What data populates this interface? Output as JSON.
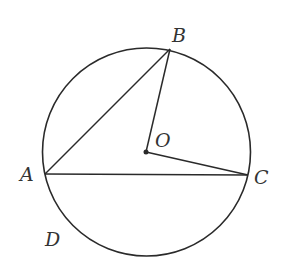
{
  "diagram": {
    "type": "circle-geometry",
    "stroke_color": "#2a2a2a",
    "circle": {
      "name": "O",
      "cx": 146.5,
      "cy": 152,
      "r": 104
    },
    "points": {
      "A": {
        "x": 45,
        "y": 174
      },
      "B": {
        "x": 170,
        "y": 49
      },
      "C": {
        "x": 248,
        "y": 175
      },
      "O": {
        "x": 146,
        "y": 152
      }
    },
    "segments": [
      "AB",
      "AC",
      "OB",
      "OC"
    ],
    "labels": {
      "A": "A",
      "B": "B",
      "C": "C",
      "O": "O",
      "D": "D"
    }
  }
}
